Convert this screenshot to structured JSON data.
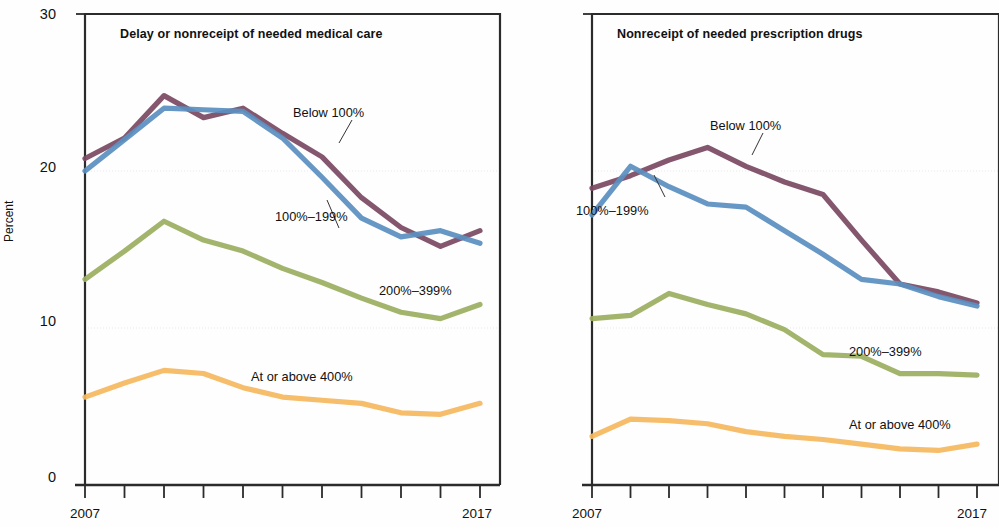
{
  "figure": {
    "y_axis_title": "Percent",
    "y_ticks": [
      "0",
      "10",
      "20",
      "30"
    ],
    "x_tick_first": "2007",
    "x_tick_last": "2017",
    "colors": {
      "below_100": "#7b4a63",
      "pct_100_199": "#5b8fc0",
      "pct_200_399": "#9caf61",
      "at_or_above_400": "#f5b860",
      "frame": "#2b2b2b",
      "grid": "#e8e8ea"
    },
    "series_labels": {
      "below_100": "Below 100%",
      "pct_100_199": "100%–199%",
      "pct_200_399": "200%–399%",
      "at_or_above_400": "At or above 400%"
    }
  },
  "chart_data": [
    {
      "type": "line",
      "title": "Delay or nonreceipt of needed medical care",
      "xlabel": "",
      "ylabel": "Percent",
      "ylim": [
        0,
        30
      ],
      "yticks": [
        0,
        10,
        20,
        30
      ],
      "grid": true,
      "legend_position": "inline-annotations",
      "x": [
        2007,
        2008,
        2009,
        2010,
        2011,
        2012,
        2013,
        2014,
        2015,
        2016,
        2017
      ],
      "xticklabels": [
        "2007",
        "",
        "",
        "",
        "",
        "",
        "",
        "",
        "",
        "",
        "2017"
      ],
      "series": [
        {
          "name": "Below 100%",
          "color": "#7b4a63",
          "values": [
            20.8,
            22.1,
            24.8,
            23.4,
            24.0,
            22.4,
            20.9,
            18.3,
            16.4,
            15.2,
            16.2
          ]
        },
        {
          "name": "100%–199%",
          "color": "#5b8fc0",
          "values": [
            20.0,
            22.0,
            24.0,
            23.9,
            23.8,
            22.1,
            19.6,
            17.0,
            15.8,
            16.2,
            15.4
          ]
        },
        {
          "name": "200%–399%",
          "color": "#9caf61",
          "values": [
            13.1,
            14.9,
            16.8,
            15.6,
            14.9,
            13.8,
            12.9,
            11.9,
            11.0,
            10.6,
            11.5
          ]
        },
        {
          "name": "At or above 400%",
          "color": "#f5b860",
          "values": [
            5.6,
            6.5,
            7.3,
            7.1,
            6.2,
            5.6,
            5.4,
            5.2,
            4.6,
            4.5,
            5.2
          ]
        }
      ]
    },
    {
      "type": "line",
      "title": "Nonreceipt of needed prescription drugs",
      "xlabel": "",
      "ylabel": "Percent",
      "ylim": [
        0,
        30
      ],
      "yticks": [
        0,
        10,
        20,
        30
      ],
      "grid": true,
      "legend_position": "inline-annotations",
      "x": [
        2007,
        2008,
        2009,
        2010,
        2011,
        2012,
        2013,
        2014,
        2015,
        2016,
        2017
      ],
      "xticklabels": [
        "2007",
        "",
        "",
        "",
        "",
        "",
        "",
        "",
        "",
        "",
        "2017"
      ],
      "series": [
        {
          "name": "Below 100%",
          "color": "#7b4a63",
          "values": [
            18.9,
            19.7,
            20.7,
            21.5,
            20.3,
            19.3,
            18.5,
            15.6,
            12.8,
            12.3,
            11.6
          ]
        },
        {
          "name": "100%–199%",
          "color": "#5b8fc0",
          "values": [
            17.2,
            20.3,
            19.0,
            17.9,
            17.7,
            16.2,
            14.7,
            13.1,
            12.8,
            12.0,
            11.4
          ]
        },
        {
          "name": "200%–399%",
          "color": "#9caf61",
          "values": [
            10.6,
            10.8,
            12.2,
            11.5,
            10.9,
            9.9,
            8.3,
            8.2,
            7.1,
            7.1,
            7.0
          ]
        },
        {
          "name": "At or above 400%",
          "color": "#f5b860",
          "values": [
            3.1,
            4.2,
            4.1,
            3.9,
            3.4,
            3.1,
            2.9,
            2.6,
            2.3,
            2.2,
            2.6
          ]
        }
      ]
    }
  ]
}
